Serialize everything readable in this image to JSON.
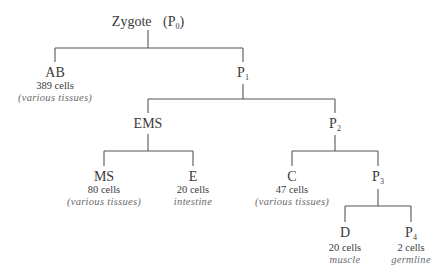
{
  "diagram": {
    "type": "lineage-tree",
    "nodes": [
      {
        "id": "P0",
        "name": "Zygote",
        "sub_prefix": "(P",
        "sub": "0",
        "sub_suffix": ")",
        "count": "",
        "fate": ""
      },
      {
        "id": "AB",
        "name": "AB",
        "count": "389 cells",
        "fate": "(various tissues)"
      },
      {
        "id": "P1",
        "name": "P",
        "sub": "1",
        "count": "",
        "fate": ""
      },
      {
        "id": "EMS",
        "name": "EMS",
        "count": "",
        "fate": ""
      },
      {
        "id": "P2",
        "name": "P",
        "sub": "2",
        "count": "",
        "fate": ""
      },
      {
        "id": "MS",
        "name": "MS",
        "count": "80 cells",
        "fate": "(various tissues)"
      },
      {
        "id": "E",
        "name": "E",
        "count": "20 cells",
        "fate": "intestine"
      },
      {
        "id": "C",
        "name": "C",
        "count": "47 cells",
        "fate": "(various tissues)"
      },
      {
        "id": "P3",
        "name": "P",
        "sub": "3",
        "count": "",
        "fate": ""
      },
      {
        "id": "D",
        "name": "D",
        "count": "20 cells",
        "fate": "muscle"
      },
      {
        "id": "P4",
        "name": "P",
        "sub": "4",
        "count": "2 cells",
        "fate": "germline"
      }
    ],
    "edges": [
      [
        "P0",
        "AB"
      ],
      [
        "P0",
        "P1"
      ],
      [
        "P1",
        "EMS"
      ],
      [
        "P1",
        "P2"
      ],
      [
        "EMS",
        "MS"
      ],
      [
        "EMS",
        "E"
      ],
      [
        "P2",
        "C"
      ],
      [
        "P2",
        "P3"
      ],
      [
        "P3",
        "D"
      ],
      [
        "P3",
        "P4"
      ]
    ]
  }
}
